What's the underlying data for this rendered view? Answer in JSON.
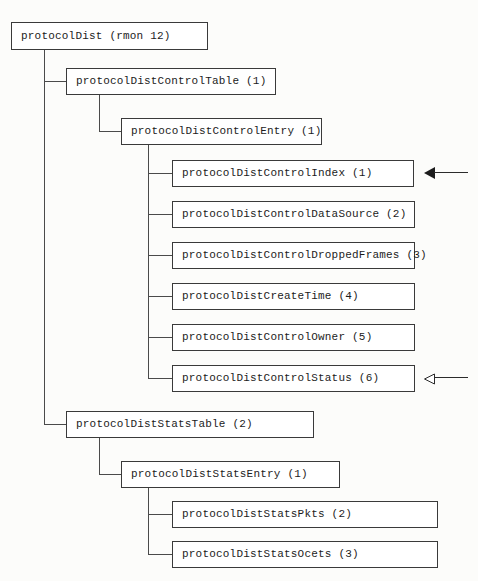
{
  "diagram": {
    "title": "protocolDist (rmon 12)",
    "root": {
      "label": "protocolDist (rmon 12)"
    },
    "branches": [
      {
        "table": {
          "label": "protocolDistControlTable (1)"
        },
        "entry": {
          "label": "protocolDistControlEntry (1)"
        },
        "leaves": [
          {
            "label": "protocolDistControlIndex (1)"
          },
          {
            "label": "protocolDistControlDataSource (2)"
          },
          {
            "label": "protocolDistControlDroppedFrames (3)"
          },
          {
            "label": "protocolDistCreateTime (4)"
          },
          {
            "label": "protocolDistControlOwner (5)"
          },
          {
            "label": "protocolDistControlStatus (6)"
          }
        ]
      },
      {
        "table": {
          "label": "protocolDistStatsTable (2)"
        },
        "entry": {
          "label": "protocolDistStatsEntry (1)"
        },
        "leaves": [
          {
            "label": "protocolDistStatsPkts (2)"
          },
          {
            "label": "protocolDistStatsOcets (3)"
          }
        ]
      }
    ],
    "annotations": [
      {
        "name": "solid-arrow",
        "style": "solid",
        "target": "protocolDistControlIndex (1)"
      },
      {
        "name": "hollow-arrow",
        "style": "hollow",
        "target": "protocolDistControlStatus (6)"
      }
    ],
    "colors": {
      "box_border": "#3a3a3a",
      "box_fill": "#ffffff",
      "connector": "#4a4a4a",
      "text": "#1c1c1c",
      "background": "#fcfcfa"
    }
  }
}
